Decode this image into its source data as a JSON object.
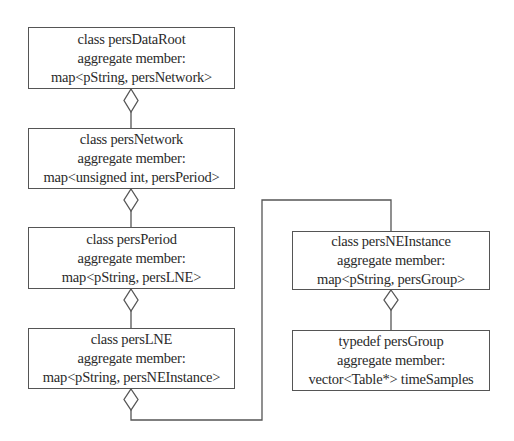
{
  "diagram": {
    "type": "class-aggregation-diagram",
    "colors": {
      "line": "#555555",
      "text": "#2a2a2a",
      "background": "#ffffff"
    },
    "boxes": [
      {
        "id": "persDataRoot",
        "title": "class persDataRoot",
        "label": "aggregate member:",
        "member": "map<pString, persNetwork>"
      },
      {
        "id": "persNetwork",
        "title": "class persNetwork",
        "label": "aggregate member:",
        "member": "map<unsigned int, persPeriod>"
      },
      {
        "id": "persPeriod",
        "title": "class persPeriod",
        "label": "aggregate member:",
        "member": "map<pString, persLNE>"
      },
      {
        "id": "persLNE",
        "title": "class persLNE",
        "label": "aggregate member:",
        "member": "map<pString, persNEInstance>"
      },
      {
        "id": "persNEInstance",
        "title": "class persNEInstance",
        "label": "aggregate member:",
        "member": "map<pString, persGroup>"
      },
      {
        "id": "persGroup",
        "title": "typedef persGroup",
        "label": "aggregate member:",
        "member": "vector<Table*> timeSamples"
      }
    ],
    "relations": [
      {
        "whole": "persDataRoot",
        "part": "persNetwork",
        "kind": "aggregation"
      },
      {
        "whole": "persNetwork",
        "part": "persPeriod",
        "kind": "aggregation"
      },
      {
        "whole": "persPeriod",
        "part": "persLNE",
        "kind": "aggregation"
      },
      {
        "whole": "persLNE",
        "part": "persNEInstance",
        "kind": "aggregation"
      },
      {
        "whole": "persNEInstance",
        "part": "persGroup",
        "kind": "aggregation"
      }
    ]
  }
}
